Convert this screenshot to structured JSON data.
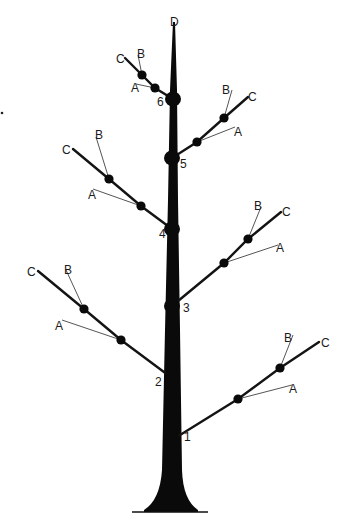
{
  "diagram": {
    "trunk": {
      "label": "D",
      "top": [
        174,
        22
      ],
      "base_y": 512,
      "base_line": [
        132,
        208
      ]
    },
    "nodes": [
      {
        "id": "1",
        "label": "1",
        "pos": [
          172,
          440
        ],
        "label_pos": [
          184,
          441
        ],
        "side": "right"
      },
      {
        "id": "2",
        "label": "2",
        "pos": [
          172,
          378
        ],
        "label_pos": [
          155,
          386
        ],
        "side": "left"
      },
      {
        "id": "3",
        "label": "3",
        "pos": [
          172,
          306
        ],
        "label_pos": [
          183,
          312
        ],
        "side": "right"
      },
      {
        "id": "4",
        "label": "4",
        "pos": [
          172,
          229
        ],
        "label_pos": [
          159,
          238
        ],
        "side": "left"
      },
      {
        "id": "5",
        "label": "5",
        "pos": [
          172,
          158
        ],
        "label_pos": [
          180,
          168
        ],
        "side": "right"
      },
      {
        "id": "6",
        "label": "6",
        "pos": [
          173,
          99
        ],
        "label_pos": [
          157,
          106
        ],
        "side": "left"
      }
    ],
    "branches": [
      {
        "node": "1",
        "dots": [
          [
            238,
            399
          ],
          [
            280,
            368
          ]
        ],
        "C": {
          "label": "C",
          "end": [
            319,
            342
          ],
          "label_pos": [
            321,
            347
          ]
        },
        "B": {
          "label": "B",
          "end": [
            293,
            335
          ],
          "label_pos": [
            284,
            342
          ]
        },
        "A": {
          "label": "A",
          "end": [
            292,
            385
          ],
          "label_pos": [
            289,
            393
          ]
        }
      },
      {
        "node": "2",
        "dots": [
          [
            121,
            340
          ],
          [
            84,
            309
          ]
        ],
        "C": {
          "label": "C",
          "end": [
            38,
            271
          ],
          "label_pos": [
            27,
            276
          ]
        },
        "B": {
          "label": "B",
          "end": [
            66,
            270
          ],
          "label_pos": [
            64,
            274
          ]
        },
        "A": {
          "label": "A",
          "end": [
            62,
            320
          ],
          "label_pos": [
            55,
            330
          ]
        }
      },
      {
        "node": "3",
        "dots": [
          [
            224,
            263
          ],
          [
            248,
            239
          ]
        ],
        "C": {
          "label": "C",
          "end": [
            281,
            212
          ],
          "label_pos": [
            282,
            216
          ]
        },
        "B": {
          "label": "B",
          "end": [
            261,
            207
          ],
          "label_pos": [
            254,
            210
          ]
        },
        "A": {
          "label": "A",
          "end": [
            278,
            245
          ],
          "label_pos": [
            276,
            252
          ]
        }
      },
      {
        "node": "4",
        "dots": [
          [
            141,
            206
          ],
          [
            109,
            179
          ]
        ],
        "C": {
          "label": "C",
          "end": [
            73,
            149
          ],
          "label_pos": [
            62,
            154
          ]
        },
        "B": {
          "label": "B",
          "end": [
            96,
            137
          ],
          "label_pos": [
            95,
            139
          ]
        },
        "A": {
          "label": "A",
          "end": [
            93,
            189
          ],
          "label_pos": [
            88,
            199
          ]
        }
      },
      {
        "node": "5",
        "dots": [
          [
            197,
            142
          ],
          [
            224,
            118
          ]
        ],
        "C": {
          "label": "C",
          "end": [
            248,
            97
          ],
          "label_pos": [
            248,
            101
          ]
        },
        "B": {
          "label": "B",
          "end": [
            232,
            90
          ],
          "label_pos": [
            222,
            94
          ]
        },
        "A": {
          "label": "A",
          "end": [
            235,
            127
          ],
          "label_pos": [
            234,
            136
          ]
        }
      },
      {
        "node": "6",
        "dots": [
          [
            155,
            88
          ],
          [
            142,
            75
          ]
        ],
        "C": {
          "label": "C",
          "end": [
            125,
            58
          ],
          "label_pos": [
            116,
            63
          ]
        },
        "B": {
          "label": "B",
          "end": [
            138,
            55
          ],
          "label_pos": [
            137,
            58
          ]
        },
        "A": {
          "label": "A",
          "end": [
            136,
            84
          ],
          "label_pos": [
            131,
            92
          ]
        }
      }
    ],
    "stray_mark": [
      2,
      113
    ]
  }
}
